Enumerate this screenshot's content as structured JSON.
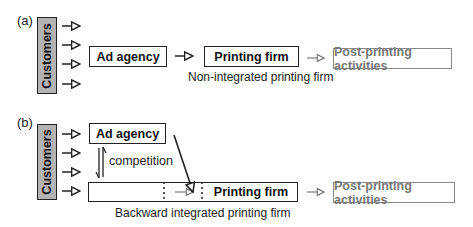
{
  "panel_a": {
    "label": "(a)",
    "customers": "Customers",
    "ad_agency": "Ad agency",
    "printing_firm": "Printing firm",
    "caption": "Non-integrated printing firm",
    "post_printing": "Post-printing activities"
  },
  "panel_b": {
    "label": "(b)",
    "customers": "Customers",
    "ad_agency": "Ad agency",
    "competition": "competition",
    "printing_firm": "Printing firm",
    "caption": "Backward integrated printing firm",
    "post_printing": "Post-printing activities"
  },
  "colors": {
    "customers_fill": "#b3b3b3",
    "stroke": "#222222",
    "muted": "#888888"
  }
}
